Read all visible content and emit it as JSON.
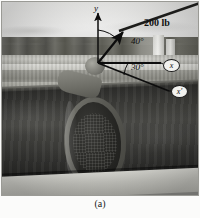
{
  "figure": {
    "caption": "(a)"
  },
  "diagram": {
    "force": {
      "label": "200 lb",
      "magnitude": 200,
      "units": "lb"
    },
    "angles": [
      {
        "name": "angle-from-y-axis",
        "label": "40°",
        "value": 40,
        "units": "deg"
      },
      {
        "name": "angle-x-to-xprime",
        "label": "30°",
        "value": 30,
        "units": "deg"
      }
    ],
    "axes": [
      {
        "name": "y-axis",
        "label": "y"
      },
      {
        "name": "x-axis",
        "label": "x"
      },
      {
        "name": "x-prime-axis",
        "label": "x′"
      }
    ],
    "colors": {
      "vector_stroke": "#0d0d0d",
      "label_text": "#101010",
      "tag_fill": "#f2f2ef"
    }
  }
}
